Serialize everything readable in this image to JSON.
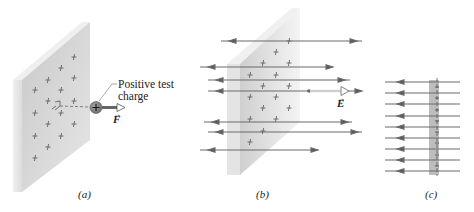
{
  "figure": {
    "colors": {
      "plate_front": "#d6d6d6",
      "plate_side": "#ececec",
      "field_line": "#6a6a6a",
      "charge_fill": "#8a8a8a",
      "text": "#222222",
      "band_c": "#b9b9b9"
    },
    "panels": [
      {
        "id": "a",
        "label": "(a)",
        "callout": [
          "Positive test",
          "charge"
        ],
        "charge_symbol": "+",
        "force_vector_label": "F",
        "elements": [
          "charged-sheet",
          "positive-test-charge",
          "force-arrow",
          "perpendicular-dashed-line",
          "right-angle-marker"
        ]
      },
      {
        "id": "b",
        "label": "(b)",
        "field_vector_label": "E",
        "field_lines_count": 7,
        "elements": [
          "charged-sheet",
          "field-lines-both-directions",
          "field-vector-arrow"
        ]
      },
      {
        "id": "c",
        "label": "(c)",
        "field_lines_count": 9,
        "elements": [
          "sheet-edge-view",
          "field-lines-edge-view"
        ]
      }
    ],
    "sheet_charge_symbol": "+"
  }
}
